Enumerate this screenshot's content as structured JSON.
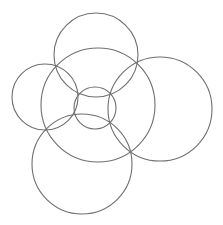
{
  "diagram": {
    "title": "",
    "stroke_color": "#6f6f6f",
    "background": "#ffffff",
    "circles": [
      {
        "name": "top-circle"
      },
      {
        "name": "left-circle"
      },
      {
        "name": "right-circle"
      },
      {
        "name": "bottom-circle"
      },
      {
        "name": "large-center-circle"
      },
      {
        "name": "small-center-circle"
      }
    ]
  }
}
